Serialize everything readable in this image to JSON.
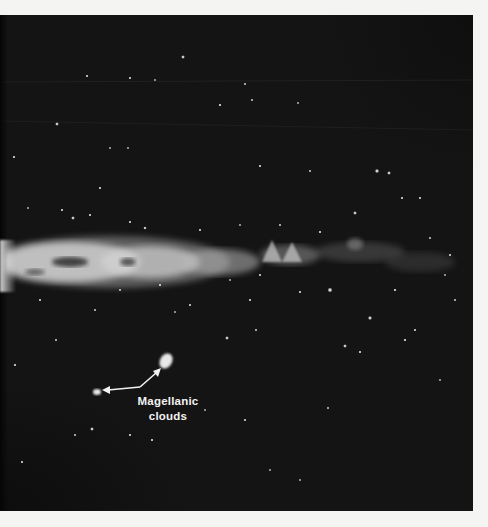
{
  "figure": {
    "annotation": {
      "line1": "Magellanic",
      "line2": "clouds"
    },
    "colors": {
      "sky": "#141414",
      "page": "#f4f4f2",
      "label": "#f2f2f2",
      "arrow": "#f2f2f2"
    }
  }
}
